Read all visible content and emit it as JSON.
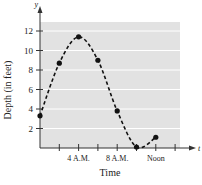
{
  "chart_data": {
    "type": "line",
    "title": "",
    "xlabel": "Time",
    "ylabel": "Depth (in feet)",
    "x_axis_var": "t",
    "y_axis_var": "y",
    "x_unit": "hours after midnight",
    "xlim": [
      0,
      14.5
    ],
    "ylim": [
      0,
      13
    ],
    "y_ticks": [
      2,
      4,
      6,
      8,
      10,
      12
    ],
    "x_ticks": [
      2,
      4,
      6,
      8,
      10,
      12,
      14
    ],
    "x_tick_labels": [
      {
        "t": 4,
        "label": "4 A.M."
      },
      {
        "t": 8,
        "label": "8 A.M."
      },
      {
        "t": 12,
        "label": "Noon"
      }
    ],
    "grid": "horizontal",
    "series": [
      {
        "name": "Depth",
        "style": "dashed curve with dot markers",
        "x": [
          0,
          2,
          4,
          6,
          8,
          10,
          12
        ],
        "values": [
          3.3,
          8.7,
          11.4,
          9.0,
          3.8,
          0.1,
          1.1
        ]
      }
    ],
    "colors": {
      "plot_background": "#e2e2e2",
      "gridline": "#ffffff",
      "curve": "#111111",
      "axis": "#333333"
    }
  }
}
